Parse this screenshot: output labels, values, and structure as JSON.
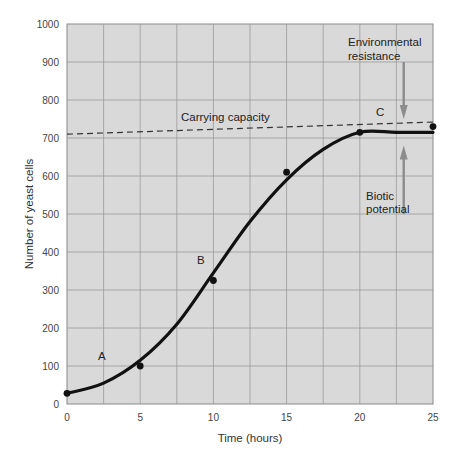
{
  "chart_data": {
    "type": "line",
    "title": "",
    "xlabel": "Time (hours)",
    "ylabel": "Number of yeast cells",
    "xlim": [
      0,
      25
    ],
    "ylim": [
      0,
      1000
    ],
    "x_ticks": [
      0,
      5,
      10,
      15,
      20,
      25
    ],
    "y_ticks": [
      0,
      100,
      200,
      300,
      400,
      500,
      600,
      700,
      800,
      900,
      1000
    ],
    "grid": true,
    "grid_x_step": 2.5,
    "grid_y_step": 100,
    "legend": null,
    "series": [
      {
        "name": "Observed yeast cells",
        "type": "scatter",
        "x": [
          0,
          5,
          10,
          15,
          20,
          25
        ],
        "y": [
          28,
          100,
          325,
          610,
          715,
          730
        ]
      },
      {
        "name": "Fitted growth curve",
        "type": "line",
        "x": [
          0,
          2.5,
          5,
          7.5,
          10,
          12.5,
          15,
          17.5,
          20,
          22.5,
          25
        ],
        "y": [
          28,
          55,
          115,
          210,
          345,
          480,
          590,
          670,
          715,
          715,
          715
        ]
      },
      {
        "name": "Carrying capacity",
        "type": "line",
        "style": "dashed",
        "x": [
          0,
          25
        ],
        "y": [
          710,
          742
        ]
      }
    ],
    "annotations": [
      {
        "text": "A",
        "x": 1.8,
        "y": 120
      },
      {
        "text": "B",
        "x": 9.0,
        "y": 370
      },
      {
        "text": "C",
        "x": 21.2,
        "y": 750
      },
      {
        "text": "Carrying capacity",
        "x": 7.7,
        "y": 760
      },
      {
        "text": "Environmental",
        "x": 20.6,
        "y": 945
      },
      {
        "text": "resistance",
        "x": 20.6,
        "y": 910
      },
      {
        "text": "Biotic",
        "x": 21.0,
        "y": 525
      },
      {
        "text": "potential",
        "x": 21.0,
        "y": 490
      }
    ],
    "arrows": [
      {
        "name": "environmental-resistance",
        "x": 23.0,
        "from_y": 900,
        "to_y": 750,
        "direction": "down"
      },
      {
        "name": "biotic-potential",
        "x": 23.0,
        "from_y": 500,
        "to_y": 680,
        "direction": "up"
      }
    ]
  },
  "colors": {
    "plot_bg": "#d9d9d9",
    "grid": "#9a9a9a",
    "curve": "#111111",
    "arrow": "#8c8c8c",
    "text": "#333333"
  },
  "labels": {
    "xlabel": "Time (hours)",
    "ylabel": "Number of yeast cells",
    "carrying_capacity": "Carrying capacity",
    "env_line1": "Environmental",
    "env_line2": "resistance",
    "bio_line1": "Biotic",
    "bio_line2": "potential",
    "A": "A",
    "B": "B",
    "C": "C"
  }
}
